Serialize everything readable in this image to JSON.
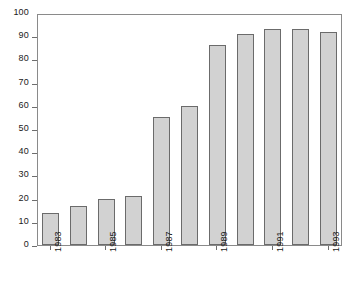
{
  "chart_data": {
    "type": "bar",
    "title": "",
    "xlabel": "",
    "ylabel": "",
    "ylim": [
      0,
      100
    ],
    "ytick_step": 10,
    "grid": false,
    "legend": null,
    "categories": [
      "1983",
      "1984",
      "1985",
      "1986",
      "1987",
      "1988",
      "1989",
      "1990",
      "1991",
      "1992",
      "1993"
    ],
    "values": [
      14,
      17,
      20,
      21,
      55,
      60,
      86,
      91,
      93,
      93,
      92
    ],
    "ytick_labels": [
      "0",
      "10",
      "20",
      "30",
      "40",
      "50",
      "60",
      "70",
      "80",
      "90",
      "100"
    ],
    "ytick_values": [
      0,
      10,
      20,
      30,
      40,
      50,
      60,
      70,
      80,
      90,
      100
    ],
    "xtick_labels": [
      "1983",
      "1985",
      "1987",
      "1989",
      "1991",
      "1993"
    ],
    "xtick_category_indices": [
      0,
      2,
      4,
      6,
      8,
      10
    ],
    "bar_fill_color": "#d2d2d2",
    "bar_edge_color": "#6b6b6b",
    "frame_color": "#8a8a8a",
    "background_color": "#ffffff",
    "text_color": "#1a1a1a"
  }
}
